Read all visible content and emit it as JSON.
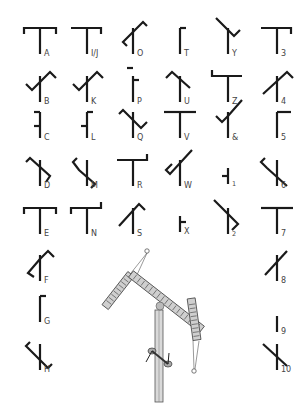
{
  "stroke_color": "#1a1a1a",
  "label_color": "#444444",
  "glyphs": [
    {
      "label": "A",
      "x": 40,
      "y": 28,
      "arms": [
        [
          [
            4,
            6
          ],
          [
            4,
            0
          ],
          [
            36,
            0
          ],
          [
            36,
            6
          ]
        ]
      ]
    },
    {
      "label": "I/J",
      "x": 87,
      "y": 28,
      "arms": [
        [
          [
            4,
            0
          ],
          [
            34,
            0
          ],
          [
            34,
            6
          ]
        ]
      ]
    },
    {
      "label": "O",
      "x": 133,
      "y": 28,
      "arms": [
        [
          [
            20,
            4
          ],
          [
            30,
            -6
          ],
          [
            34,
            -2
          ]
        ],
        [
          [
            20,
            4
          ],
          [
            10,
            14
          ],
          [
            14,
            18
          ]
        ]
      ]
    },
    {
      "label": "T",
      "x": 180,
      "y": 28,
      "arms": [
        [
          [
            20,
            0
          ],
          [
            26,
            0
          ]
        ]
      ]
    },
    {
      "label": "Y",
      "x": 228,
      "y": 28,
      "arms": [
        [
          [
            8,
            -10
          ],
          [
            20,
            2
          ],
          [
            26,
            8
          ],
          [
            32,
            2
          ]
        ]
      ]
    },
    {
      "label": "3",
      "x": 277,
      "y": 28,
      "arms": [
        [
          [
            4,
            0
          ],
          [
            34,
            0
          ],
          [
            34,
            6
          ]
        ]
      ]
    },
    {
      "label": "B",
      "x": 40,
      "y": 76,
      "arms": [
        [
          [
            20,
            6
          ],
          [
            30,
            -4
          ],
          [
            36,
            2
          ]
        ],
        [
          [
            20,
            6
          ],
          [
            12,
            14
          ],
          [
            6,
            8
          ]
        ]
      ]
    },
    {
      "label": "K",
      "x": 87,
      "y": 76,
      "arms": [
        [
          [
            20,
            6
          ],
          [
            30,
            -4
          ],
          [
            36,
            2
          ]
        ],
        [
          [
            20,
            6
          ],
          [
            12,
            14
          ],
          [
            6,
            8
          ]
        ]
      ]
    },
    {
      "label": "P",
      "x": 133,
      "y": 76,
      "arms": [
        [
          [
            14,
            -8
          ],
          [
            20,
            -8
          ]
        ],
        [
          [
            20,
            4
          ],
          [
            26,
            4
          ]
        ]
      ]
    },
    {
      "label": "U",
      "x": 180,
      "y": 76,
      "arms": [
        [
          [
            6,
            2
          ],
          [
            12,
            -4
          ],
          [
            30,
            12
          ]
        ]
      ]
    },
    {
      "label": "Z",
      "x": 228,
      "y": 76,
      "arms": [
        [
          [
            4,
            -6
          ],
          [
            4,
            0
          ],
          [
            34,
            0
          ]
        ]
      ]
    },
    {
      "label": "4",
      "x": 277,
      "y": 76,
      "arms": [
        [
          [
            6,
            18
          ],
          [
            30,
            -4
          ],
          [
            36,
            2
          ]
        ]
      ]
    },
    {
      "label": "C",
      "x": 40,
      "y": 112,
      "arms": [
        [
          [
            14,
            0
          ],
          [
            20,
            0
          ]
        ],
        [
          [
            14,
            14
          ],
          [
            20,
            14
          ]
        ]
      ]
    },
    {
      "label": "L",
      "x": 87,
      "y": 112,
      "arms": [
        [
          [
            20,
            0
          ],
          [
            26,
            0
          ]
        ],
        [
          [
            14,
            14
          ],
          [
            20,
            14
          ]
        ]
      ]
    },
    {
      "label": "Q",
      "x": 133,
      "y": 112,
      "arms": [
        [
          [
            6,
            2
          ],
          [
            10,
            -2
          ],
          [
            28,
            16
          ],
          [
            34,
            10
          ]
        ]
      ]
    },
    {
      "label": "V",
      "x": 180,
      "y": 112,
      "arms": [
        [
          [
            4,
            0
          ],
          [
            36,
            0
          ]
        ]
      ]
    },
    {
      "label": "&",
      "x": 228,
      "y": 112,
      "arms": [
        [
          [
            34,
            -12
          ],
          [
            20,
            4
          ],
          [
            14,
            10
          ],
          [
            8,
            4
          ]
        ]
      ]
    },
    {
      "label": "5",
      "x": 277,
      "y": 112,
      "arms": [
        [
          [
            20,
            0
          ],
          [
            34,
            0
          ]
        ]
      ]
    },
    {
      "label": "D",
      "x": 40,
      "y": 160,
      "arms": [
        [
          [
            6,
            2
          ],
          [
            10,
            -2
          ],
          [
            30,
            16
          ],
          [
            26,
            22
          ]
        ]
      ]
    },
    {
      "label": "M",
      "x": 87,
      "y": 160,
      "arms": [
        [
          [
            10,
            -2
          ],
          [
            6,
            2
          ],
          [
            12,
            10
          ],
          [
            28,
            24
          ],
          [
            24,
            28
          ]
        ]
      ]
    },
    {
      "label": "R",
      "x": 133,
      "y": 160,
      "arms": [
        [
          [
            4,
            0
          ],
          [
            34,
            0
          ],
          [
            34,
            -6
          ]
        ]
      ]
    },
    {
      "label": "W",
      "x": 180,
      "y": 160,
      "arms": [
        [
          [
            32,
            -10
          ],
          [
            10,
            14
          ],
          [
            6,
            10
          ],
          [
            12,
            4
          ]
        ]
      ]
    },
    {
      "label": "1",
      "x": 228,
      "y": 160,
      "arms": [
        [
          [
            14,
            16
          ],
          [
            20,
            16
          ]
        ]
      ],
      "short": true
    },
    {
      "label": "6",
      "x": 277,
      "y": 160,
      "arms": [
        [
          [
            8,
            -2
          ],
          [
            4,
            2
          ],
          [
            10,
            8
          ],
          [
            30,
            26
          ]
        ]
      ]
    },
    {
      "label": "E",
      "x": 40,
      "y": 208,
      "arms": [
        [
          [
            4,
            6
          ],
          [
            4,
            0
          ],
          [
            36,
            0
          ],
          [
            36,
            6
          ]
        ]
      ]
    },
    {
      "label": "N",
      "x": 87,
      "y": 208,
      "arms": [
        [
          [
            4,
            6
          ],
          [
            4,
            0
          ],
          [
            34,
            0
          ],
          [
            34,
            -6
          ]
        ]
      ]
    },
    {
      "label": "S",
      "x": 133,
      "y": 208,
      "arms": [
        [
          [
            6,
            18
          ],
          [
            26,
            -4
          ],
          [
            32,
            2
          ]
        ]
      ]
    },
    {
      "label": "X",
      "x": 180,
      "y": 208,
      "arms": [
        [
          [
            20,
            14
          ],
          [
            26,
            14
          ]
        ]
      ],
      "short": true
    },
    {
      "label": "2",
      "x": 228,
      "y": 208,
      "arms": [
        [
          [
            6,
            -8
          ],
          [
            30,
            16
          ],
          [
            24,
            22
          ]
        ]
      ]
    },
    {
      "label": "7",
      "x": 277,
      "y": 208,
      "arms": [
        [
          [
            4,
            0
          ],
          [
            36,
            0
          ]
        ]
      ]
    },
    {
      "label": "F",
      "x": 40,
      "y": 255,
      "arms": [
        [
          [
            20,
            4
          ],
          [
            28,
            -4
          ],
          [
            34,
            2
          ]
        ],
        [
          [
            20,
            4
          ],
          [
            8,
            18
          ],
          [
            14,
            22
          ]
        ]
      ]
    },
    {
      "label": "8",
      "x": 277,
      "y": 255,
      "arms": [
        [
          [
            8,
            20
          ],
          [
            30,
            -4
          ]
        ]
      ]
    },
    {
      "label": "G",
      "x": 40,
      "y": 296,
      "arms": [
        [
          [
            20,
            0
          ],
          [
            26,
            0
          ]
        ]
      ]
    },
    {
      "label": "9",
      "x": 277,
      "y": 308,
      "arms": [],
      "short": true
    },
    {
      "label": "H",
      "x": 40,
      "y": 344,
      "arms": [
        [
          [
            10,
            -2
          ],
          [
            6,
            2
          ],
          [
            14,
            10
          ],
          [
            28,
            24
          ],
          [
            32,
            20
          ]
        ]
      ]
    },
    {
      "label": "10",
      "x": 277,
      "y": 344,
      "arms": [
        [
          [
            6,
            0
          ],
          [
            30,
            22
          ]
        ]
      ]
    }
  ],
  "illustration": {
    "name": "semaphore-tower-illustration",
    "description": "Telegraph mast with two ladder-like signal arms and pulley cords"
  }
}
